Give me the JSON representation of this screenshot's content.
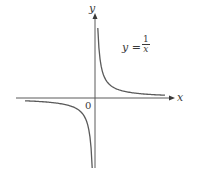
{
  "chart_data": {
    "type": "line",
    "title": "",
    "function": "y = 1/x",
    "xlabel": "x",
    "ylabel": "y",
    "origin_label": "0",
    "annotation": {
      "lhs": "y =",
      "numerator": "1",
      "denominator": "x"
    },
    "grid": false,
    "legend": null,
    "series": [
      {
        "name": "y = 1/x (x > 0)",
        "x": [
          0.2,
          0.3,
          0.5,
          0.75,
          1,
          1.5,
          2,
          3,
          4,
          5
        ],
        "y": [
          5,
          3.33,
          2,
          1.33,
          1,
          0.67,
          0.5,
          0.33,
          0.25,
          0.2
        ]
      },
      {
        "name": "y = 1/x (x < 0)",
        "x": [
          -5,
          -4,
          -3,
          -2,
          -1.5,
          -1,
          -0.75,
          -0.5,
          -0.3,
          -0.2
        ],
        "y": [
          -0.2,
          -0.25,
          -0.33,
          -0.5,
          -0.67,
          -1,
          -1.33,
          -2,
          -3.33,
          -5
        ]
      }
    ],
    "colors": {
      "curve": "#5a5a5a",
      "axis": "#5a5a5a",
      "text": "#3a3a3a"
    }
  },
  "labels": {
    "x_axis": "x",
    "y_axis": "y",
    "origin": "0",
    "eq_lhs": "y =",
    "eq_num": "1",
    "eq_den": "x"
  }
}
